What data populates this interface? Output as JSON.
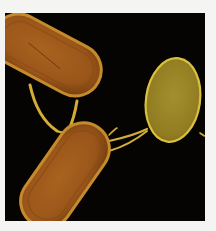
{
  "image": {
    "subject": "bacterial-conjugation-micrograph",
    "description": "Three rod/oval shaped bacterial cells on black background connected by pili",
    "colors": {
      "page_background": "#f4f4f2",
      "panel_background": "#050402",
      "cell_large_fill": "#a8601c",
      "cell_large_rim": "#c98a2a",
      "cell_small_fill": "#a08a28",
      "cell_small_rim": "#d8c040",
      "pili": "#d9b437"
    },
    "cells": [
      {
        "name": "upper-left-cell",
        "shape": "rod"
      },
      {
        "name": "lower-cell",
        "shape": "rod"
      },
      {
        "name": "right-cell",
        "shape": "oval"
      }
    ]
  }
}
